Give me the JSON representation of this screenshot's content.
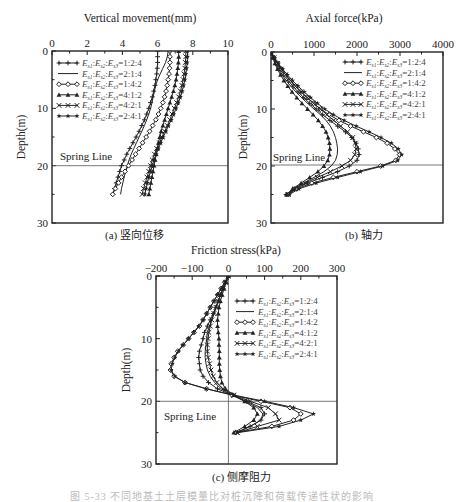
{
  "figure": {
    "bottom_caption": "图 5-33 不同地基土土层模量比对桩沉降和荷载传递性状的影响"
  },
  "legend_entries": [
    {
      "label": "Es1:Es2:Es3=1:2:4",
      "ratio": "=1:2:4",
      "marker": "plus"
    },
    {
      "label": "Es1:Es2:Es3=2:1:4",
      "ratio": "=2:1:4",
      "marker": "none"
    },
    {
      "label": "Es1:Es2:Es3=1:4:2",
      "ratio": "=1:4:2",
      "marker": "diamond"
    },
    {
      "label": "Es1:Es2:Es3=4:1:2",
      "ratio": "=4:1:2",
      "marker": "triangle"
    },
    {
      "label": "Es1:Es2:Es3=4:2:1",
      "ratio": "=4:2:1",
      "marker": "cross"
    },
    {
      "label": "Es1:Es2:Es3=2:4:1",
      "ratio": "=2:4:1",
      "marker": "star"
    }
  ],
  "chart_data": [
    {
      "id": "a",
      "type": "line",
      "title": "Vertical movement(mm)",
      "caption": "(a) 竖向位移",
      "xlabel": "Vertical movement(mm)",
      "ylabel": "Depth(m)",
      "xlim": [
        0,
        10
      ],
      "ylim": [
        0,
        30
      ],
      "xticks": [
        0,
        2,
        4,
        6,
        8,
        10
      ],
      "yticks": [
        0,
        10,
        20,
        30
      ],
      "y_inverted": true,
      "x_axis_position": "top",
      "reference_line": {
        "type": "horizontal",
        "y": 20,
        "label": "Spring Line"
      },
      "legend_position": "upper left",
      "depth": [
        0,
        1,
        2,
        3,
        4,
        5,
        6,
        7,
        8,
        9,
        10,
        11,
        12,
        13,
        14,
        15,
        16,
        17,
        18,
        19,
        20,
        21,
        22,
        23,
        24,
        25
      ],
      "series": [
        {
          "name": "Es1:Es2:Es3=1:2:4",
          "marker": "plus",
          "values": [
            6.0,
            6.0,
            6.0,
            5.98,
            5.95,
            5.9,
            5.85,
            5.78,
            5.7,
            5.6,
            5.5,
            5.38,
            5.25,
            5.1,
            4.95,
            4.78,
            4.6,
            4.42,
            4.25,
            4.1,
            3.95,
            3.85,
            3.75,
            3.65,
            3.55,
            3.45
          ]
        },
        {
          "name": "Es1:Es2:Es3=2:1:4",
          "marker": "none",
          "values": [
            6.6,
            6.55,
            6.45,
            6.3,
            6.15,
            6.0,
            5.9,
            5.82,
            5.75,
            5.68,
            5.6,
            5.5,
            5.38,
            5.25,
            5.1,
            4.95,
            4.8,
            4.65,
            4.5,
            4.38,
            4.28,
            4.18,
            4.1,
            4.02,
            3.95,
            3.9
          ]
        },
        {
          "name": "Es1:Es2:Es3=1:4:2",
          "marker": "diamond",
          "values": [
            6.7,
            6.7,
            6.7,
            6.68,
            6.65,
            6.6,
            6.55,
            6.48,
            6.4,
            6.3,
            6.18,
            6.05,
            5.9,
            5.72,
            5.55,
            5.35,
            5.15,
            4.95,
            4.75,
            4.55,
            4.35,
            4.15,
            3.95,
            3.78,
            3.6,
            3.45
          ]
        },
        {
          "name": "Es1:Es2:Es3=4:1:2",
          "marker": "triangle",
          "values": [
            7.2,
            7.2,
            7.18,
            7.15,
            7.1,
            7.05,
            6.98,
            6.9,
            6.8,
            6.7,
            6.6,
            6.5,
            6.4,
            6.3,
            6.2,
            6.12,
            6.05,
            5.98,
            5.92,
            5.86,
            5.8,
            5.74,
            5.68,
            5.62,
            5.56,
            5.5
          ]
        },
        {
          "name": "Es1:Es2:Es3=4:2:1",
          "marker": "cross",
          "values": [
            7.6,
            7.6,
            7.58,
            7.55,
            7.5,
            7.45,
            7.38,
            7.3,
            7.2,
            7.08,
            6.95,
            6.82,
            6.7,
            6.55,
            6.4,
            6.25,
            6.1,
            5.95,
            5.82,
            5.7,
            5.6,
            5.5,
            5.4,
            5.3,
            5.2,
            5.12
          ]
        },
        {
          "name": "Es1:Es2:Es3=2:4:1",
          "marker": "star",
          "values": [
            7.7,
            7.7,
            7.68,
            7.65,
            7.6,
            7.55,
            7.48,
            7.4,
            7.3,
            7.18,
            7.05,
            6.92,
            6.78,
            6.62,
            6.48,
            6.32,
            6.18,
            6.05,
            5.92,
            5.8,
            5.7,
            5.6,
            5.5,
            5.42,
            5.35,
            5.28
          ]
        }
      ]
    },
    {
      "id": "b",
      "type": "line",
      "title": "Axial force(kPa)",
      "caption": "(b) 轴力",
      "xlabel": "Axial force(kPa)",
      "ylabel": "Depth(m)",
      "xlim": [
        0,
        4000
      ],
      "ylim": [
        0,
        30
      ],
      "xticks": [
        0,
        1000,
        2000,
        3000,
        4000
      ],
      "yticks": [
        0,
        10,
        20,
        30
      ],
      "y_inverted": true,
      "x_axis_position": "top",
      "reference_line": {
        "type": "horizontal",
        "y": 20,
        "label": "Spring Line"
      },
      "legend_position": "upper right",
      "depth": [
        0,
        1,
        2,
        3,
        4,
        5,
        6,
        7,
        8,
        9,
        10,
        11,
        12,
        13,
        14,
        15,
        16,
        17,
        18,
        19,
        20,
        21,
        22,
        23,
        24,
        25
      ],
      "series": [
        {
          "name": "Es1:Es2:Es3=1:2:4",
          "marker": "plus",
          "values": [
            0,
            60,
            130,
            210,
            300,
            400,
            510,
            630,
            760,
            900,
            1050,
            1200,
            1370,
            1550,
            1730,
            1880,
            1980,
            2030,
            2050,
            2000,
            1820,
            1550,
            1200,
            850,
            550,
            350
          ]
        },
        {
          "name": "Es1:Es2:Es3=2:1:4",
          "marker": "none",
          "values": [
            0,
            50,
            110,
            180,
            260,
            350,
            460,
            580,
            710,
            850,
            1000,
            1150,
            1280,
            1380,
            1450,
            1500,
            1530,
            1550,
            1540,
            1500,
            1400,
            1230,
            1000,
            750,
            530,
            380
          ]
        },
        {
          "name": "Es1:Es2:Es3=1:4:2",
          "marker": "diamond",
          "values": [
            0,
            70,
            150,
            240,
            340,
            450,
            570,
            700,
            840,
            990,
            1150,
            1350,
            1580,
            1850,
            2150,
            2450,
            2700,
            2880,
            2990,
            2900,
            2550,
            2000,
            1450,
            950,
            600,
            400
          ]
        },
        {
          "name": "Es1:Es2:Es3=4:1:2",
          "marker": "triangle",
          "values": [
            0,
            40,
            90,
            150,
            220,
            300,
            390,
            490,
            600,
            720,
            850,
            980,
            1100,
            1200,
            1280,
            1330,
            1360,
            1370,
            1360,
            1320,
            1230,
            1090,
            900,
            700,
            500,
            360
          ]
        },
        {
          "name": "Es1:Es2:Es3=4:2:1",
          "marker": "cross",
          "values": [
            0,
            70,
            150,
            240,
            340,
            450,
            570,
            700,
            840,
            990,
            1150,
            1300,
            1460,
            1620,
            1780,
            1900,
            1960,
            1980,
            1950,
            1850,
            1650,
            1380,
            1080,
            800,
            560,
            400
          ]
        },
        {
          "name": "Es1:Es2:Es3=2:4:1",
          "marker": "star",
          "values": [
            0,
            80,
            170,
            270,
            380,
            500,
            630,
            770,
            920,
            1080,
            1250,
            1450,
            1700,
            1980,
            2280,
            2560,
            2800,
            2960,
            3040,
            2950,
            2600,
            2080,
            1550,
            1050,
            650,
            430
          ]
        }
      ]
    },
    {
      "id": "c",
      "type": "line",
      "title": "Friction stress(kPa)",
      "caption": "(c) 侧摩阻力",
      "xlabel": "Friction stress(kPa)",
      "ylabel": "Depth(m)",
      "xlim": [
        -200,
        300
      ],
      "ylim": [
        0,
        30
      ],
      "xticks": [
        -200,
        -100,
        0,
        100,
        200,
        300
      ],
      "yticks": [
        0,
        10,
        20,
        30
      ],
      "y_inverted": true,
      "x_axis_position": "top",
      "reference_line": {
        "type": "horizontal",
        "y": 20,
        "label": "Spring Line"
      },
      "zero_line": {
        "type": "vertical",
        "x": 0
      },
      "legend_position": "upper right",
      "depth": [
        0,
        1,
        2,
        3,
        4,
        5,
        6,
        7,
        8,
        9,
        10,
        11,
        12,
        13,
        14,
        15,
        16,
        17,
        18,
        19,
        20,
        21,
        22,
        23,
        24,
        25
      ],
      "series": [
        {
          "name": "Es1:Es2:Es3=1:2:4",
          "marker": "plus",
          "values": [
            0,
            -8,
            -15,
            -22,
            -28,
            -35,
            -42,
            -50,
            -58,
            -66,
            -70,
            -75,
            -80,
            -82,
            -80,
            -78,
            -70,
            -55,
            -30,
            10,
            50,
            90,
            100,
            90,
            60,
            20
          ]
        },
        {
          "name": "Es1:Es2:Es3=2:1:4",
          "marker": "none",
          "values": [
            0,
            -8,
            -15,
            -22,
            -28,
            -34,
            -40,
            -46,
            -52,
            -58,
            -60,
            -62,
            -64,
            -64,
            -62,
            -58,
            -50,
            -38,
            -20,
            10,
            45,
            80,
            95,
            90,
            60,
            25
          ]
        },
        {
          "name": "Es1:Es2:Es3=1:4:2",
          "marker": "diamond",
          "values": [
            0,
            -10,
            -20,
            -30,
            -40,
            -50,
            -60,
            -70,
            -80,
            -95,
            -110,
            -125,
            -140,
            -150,
            -158,
            -160,
            -150,
            -120,
            -60,
            10,
            90,
            170,
            200,
            180,
            120,
            20
          ]
        },
        {
          "name": "Es1:Es2:Es3=4:1:2",
          "marker": "triangle",
          "values": [
            0,
            -6,
            -12,
            -17,
            -22,
            -26,
            -28,
            -30,
            -30,
            -28,
            -26,
            -26,
            -25,
            -25,
            -25,
            -24,
            -22,
            -18,
            -8,
            15,
            45,
            70,
            80,
            70,
            45,
            15
          ]
        },
        {
          "name": "Es1:Es2:Es3=4:2:1",
          "marker": "cross",
          "values": [
            0,
            -8,
            -15,
            -22,
            -28,
            -34,
            -40,
            -46,
            -50,
            -54,
            -56,
            -58,
            -58,
            -56,
            -52,
            -48,
            -42,
            -32,
            -15,
            15,
            60,
            110,
            130,
            140,
            80,
            25
          ]
        },
        {
          "name": "Es1:Es2:Es3=2:4:1",
          "marker": "star",
          "values": [
            0,
            -10,
            -20,
            -30,
            -40,
            -50,
            -60,
            -70,
            -82,
            -96,
            -110,
            -125,
            -138,
            -148,
            -155,
            -158,
            -148,
            -120,
            -62,
            15,
            100,
            180,
            235,
            200,
            140,
            25
          ]
        }
      ]
    }
  ]
}
